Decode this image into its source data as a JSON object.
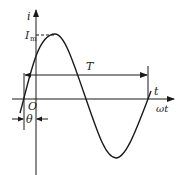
{
  "diagram": {
    "type": "sinusoidal-current-waveform",
    "labels": {
      "y_axis": "i",
      "peak": "I",
      "peak_sub": "m",
      "period": "T",
      "x_axis_t": "t",
      "x_axis_wt": "ωt",
      "origin": "O",
      "phase": "θ"
    },
    "colors": {
      "stroke": "#1a1a1a",
      "background": "#ffffff"
    }
  }
}
